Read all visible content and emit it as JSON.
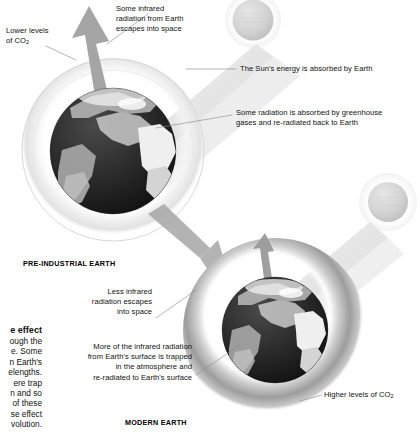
{
  "diagram": {
    "type": "greenhouse-effect-comparison",
    "scenes": [
      {
        "id": "pre-industrial",
        "label": "PRE-INDUSTRIAL EARTH"
      },
      {
        "id": "modern",
        "label": "MODERN EARTH"
      }
    ]
  },
  "annotations": {
    "lower_co2": {
      "line1": "Lower levels",
      "line2": "of CO",
      "sub": "2"
    },
    "escapes_top": {
      "line1": "Some infrared",
      "line2": "radiation from Earth",
      "line3": "escapes into space"
    },
    "sun_absorbed": {
      "text": "The Sun's energy is absorbed by Earth"
    },
    "re_radiated": {
      "line1": "Some radiation is absorbed by greenhouse",
      "line2": "gases and re-radiated back to Earth"
    },
    "less_escapes": {
      "line1": "Less infrared",
      "line2": "radiation escapes",
      "line3": "into space"
    },
    "more_trapped": {
      "line1": "More of the infrared radiation",
      "line2": "from Earth's surface is trapped",
      "line3": "in the atmosphere and",
      "line4": "re-radiated to Earth's surface"
    },
    "higher_co2": {
      "text": "Higher levels of CO",
      "sub": "2"
    }
  },
  "body_copy": {
    "heading_fragment": "e effect",
    "lines": [
      "ough the",
      "e. Some",
      "n Earth's",
      "elengths.",
      "ere trap",
      "n and so",
      "of these",
      "se effect",
      "volution."
    ]
  },
  "colors": {
    "ink": "#111111",
    "leader_line": "#8e8e8e",
    "arrow_gray": "#9d9d9d",
    "sunray_pale": "#e4e4e4",
    "sun_sphere": "#d6d6d6",
    "atmosphere_thin": "#e9e9e9",
    "atmosphere_thick": "#a8a8a8",
    "ocean": "#232323",
    "land": "#b9b9b9"
  }
}
